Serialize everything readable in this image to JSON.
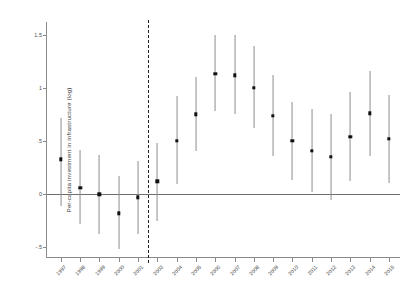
{
  "chart_data": {
    "type": "scatter",
    "title": "",
    "xlabel": "",
    "ylabel": "Per-capita investment in infrastructure (log)",
    "ylim": [
      -0.6,
      1.62
    ],
    "yticks": [
      1.5,
      1,
      0.5,
      0,
      -0.5
    ],
    "ytick_labels": [
      "1.5",
      "1",
      ".5",
      "0",
      "-.5"
    ],
    "grid": false,
    "legend": null,
    "zero_line": 0,
    "treatment_cutoff_after": "2001",
    "categories": [
      "1997",
      "1998",
      "1999",
      "2000",
      "2001",
      "2003",
      "2004",
      "2005",
      "2006",
      "2007",
      "2008",
      "2009",
      "2010",
      "2011",
      "2012",
      "2013",
      "2014",
      "2015"
    ],
    "series": [
      {
        "name": "Point estimate",
        "values": [
          0.33,
          0.06,
          0.0,
          -0.18,
          -0.03,
          0.12,
          0.5,
          0.75,
          1.13,
          1.12,
          1.0,
          0.74,
          0.5,
          0.41,
          0.35,
          0.54,
          0.76,
          0.52
        ],
        "ci_low": [
          -0.11,
          -0.28,
          -0.37,
          -0.52,
          -0.37,
          -0.25,
          0.1,
          0.41,
          0.78,
          0.75,
          0.62,
          0.36,
          0.13,
          0.02,
          -0.05,
          0.12,
          0.36,
          0.11
        ],
        "ci_high": [
          0.72,
          0.42,
          0.37,
          0.17,
          0.31,
          0.48,
          0.92,
          1.1,
          1.5,
          1.5,
          1.39,
          1.12,
          0.87,
          0.8,
          0.75,
          0.96,
          1.16,
          0.93
        ]
      }
    ]
  },
  "colors": {
    "point": "#111111",
    "interval": "#8d8d8d",
    "axis": "#8a8a8a",
    "zero_line": "#6f6f6f",
    "cut_line": "#202020",
    "background": "#ffffff"
  }
}
